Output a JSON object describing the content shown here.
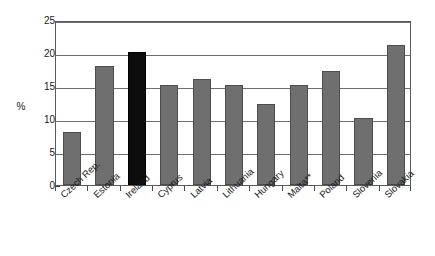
{
  "chart_data": {
    "type": "bar",
    "title": "",
    "subtitle": "",
    "xlabel": "",
    "ylabel": "%",
    "ylim": [
      0,
      25
    ],
    "yticks": [
      0,
      5,
      10,
      15,
      20,
      25
    ],
    "ytick_labels": [
      "0",
      "5",
      "10",
      "15",
      "20",
      "25"
    ],
    "grid": true,
    "legend": false,
    "legend_position": "none",
    "categories": [
      "Czech Rep.",
      "Estonia",
      "Ireland",
      "Cyprus",
      "Latvia",
      "Lithuania",
      "Hungary",
      "Malta**",
      "Poland",
      "Slovenia",
      "Slovakia"
    ],
    "values": [
      8.1,
      18.1,
      20.1,
      15.1,
      16.1,
      15.1,
      12.2,
      15.1,
      17.2,
      10.2,
      21.2
    ],
    "bar_colors": [
      "#6f6f6f",
      "#6f6f6f",
      "#0d0d0d",
      "#6f6f6f",
      "#6f6f6f",
      "#6f6f6f",
      "#6f6f6f",
      "#6f6f6f",
      "#6f6f6f",
      "#6f6f6f",
      "#6f6f6f"
    ],
    "highlight_category": "Ireland",
    "colors": {
      "bar_default": "#6f6f6f",
      "bar_highlight": "#0d0d0d",
      "gridline": "#6e6e6e",
      "axis": "#5a5a5a",
      "text": "#1a1a1a",
      "background": "#ffffff"
    }
  }
}
